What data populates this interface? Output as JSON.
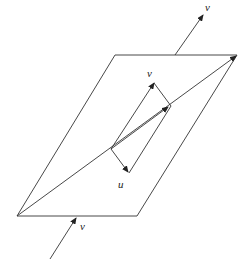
{
  "diagram": {
    "labels": {
      "v_top": "v",
      "v_inner": "v",
      "u_inner": "u",
      "v_bottom": "v"
    },
    "colors": {
      "stroke": "#333333",
      "background": "#ffffff"
    }
  }
}
